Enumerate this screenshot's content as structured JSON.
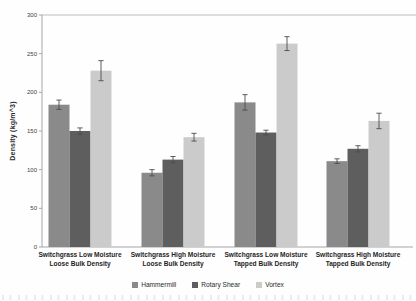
{
  "figure": {
    "y_axis_title": "Density (kg/m^3)"
  },
  "chart_data": {
    "type": "bar",
    "title": "",
    "xlabel": "",
    "ylabel": "Density (kg/m^3)",
    "ylim": [
      0,
      300
    ],
    "ytick_step": 50,
    "grid": false,
    "legend_position": "bottom",
    "error_bars": true,
    "categories": [
      "Switchgrass Low Moisture Loose Bulk Density",
      "Switchgrass High Moisture Loose Bulk Density",
      "Switchgrass Low Moisture Tapped Bulk Density",
      "Switchgrass High Moisture Tapped Bulk Density"
    ],
    "categories_wrapped": [
      [
        "Switchgrass Low Moisture",
        "Loose Bulk Density"
      ],
      [
        "Switchgrass High Moisture",
        "Loose Bulk Density"
      ],
      [
        "Switchgrass Low Moisture",
        "Tapped Bulk Density"
      ],
      [
        "Switchgrass High Moisture",
        "Tapped Bulk Density"
      ]
    ],
    "series": [
      {
        "name": "Hammermill",
        "color": "#8a8a8a",
        "values": [
          184,
          96,
          187,
          111
        ],
        "errors": [
          6,
          4,
          10,
          3
        ]
      },
      {
        "name": "Rotary Shear",
        "color": "#5e5e5e",
        "values": [
          150,
          113,
          148,
          127
        ],
        "errors": [
          4,
          4,
          3,
          4
        ]
      },
      {
        "name": "Vortex",
        "color": "#cbcbcb",
        "values": [
          228,
          142,
          263,
          163
        ],
        "errors": [
          13,
          5,
          9,
          10
        ]
      }
    ],
    "colors": {
      "axis": "#a6a6a6",
      "tick_label": "#404040",
      "error_bar": "#4d4d4d"
    }
  }
}
